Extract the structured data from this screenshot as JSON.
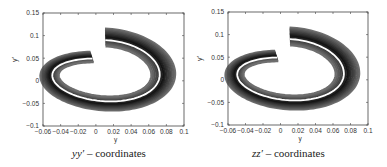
{
  "chart_data": [
    {
      "type": "line",
      "title": "",
      "caption_var": "yy′",
      "caption_text": "coordinates",
      "xlabel": "y",
      "ylabel": "y′",
      "xlim": [
        -0.06,
        0.1
      ],
      "ylim": [
        -0.1,
        0.15
      ],
      "xticks": [
        "-0.06",
        "-0.04",
        "-0.02",
        "0",
        "0.02",
        "0.04",
        "0.06",
        "0.08",
        "0.1"
      ],
      "yticks": [
        "-0.1",
        "-0.05",
        "0",
        "0.05",
        "0.1",
        "0.15"
      ],
      "description": "Phase-space spiral band of particle trajectories, gradient-shaded, with white central reference orbit",
      "center_orbit": {
        "x_range": [
          -0.05,
          0.07
        ],
        "y_range": [
          -0.06,
          0.09
        ]
      },
      "band_extent": {
        "x_range": [
          -0.06,
          0.09
        ],
        "y_range": [
          -0.08,
          0.12
        ]
      }
    },
    {
      "type": "line",
      "title": "",
      "caption_var": "zz′",
      "caption_text": "coordinates",
      "xlabel": "y",
      "ylabel": "y′",
      "xlim": [
        -0.06,
        0.1
      ],
      "ylim": [
        -0.1,
        0.15
      ],
      "xticks": [
        "-0.06",
        "-0.04",
        "-0.02",
        "0",
        "0.02",
        "0.04",
        "0.06",
        "0.08",
        "0.1"
      ],
      "yticks": [
        "-0.1",
        "-0.05",
        "0",
        "0.05",
        "0.1",
        "0.15"
      ],
      "description": "Phase-space spiral band of particle trajectories, gradient-shaded, with white central reference orbit",
      "center_orbit": {
        "x_range": [
          -0.05,
          0.07
        ],
        "y_range": [
          -0.06,
          0.09
        ]
      },
      "band_extent": {
        "x_range": [
          -0.06,
          0.09
        ],
        "y_range": [
          -0.08,
          0.12
        ]
      }
    }
  ],
  "panels": [
    {
      "caption_var": "yy′",
      "caption_sep": " – ",
      "caption_text": "coordinates",
      "xlabel": "y",
      "ylabel": "y′"
    },
    {
      "caption_var": "zz′",
      "caption_sep": " – ",
      "caption_text": "coordinates",
      "xlabel": "y",
      "ylabel": "y′"
    }
  ]
}
